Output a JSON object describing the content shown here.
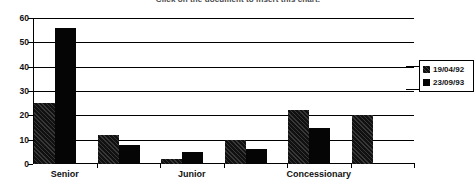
{
  "chart_data": {
    "type": "bar",
    "title": "Click on the document to insert this chart.",
    "xlabel": "",
    "ylabel": "",
    "ylim": [
      0,
      60
    ],
    "yticks": [
      0,
      10,
      20,
      30,
      40,
      50,
      60
    ],
    "ytick_labels": [
      "0",
      "10",
      "20",
      "30",
      "40",
      "50",
      "60"
    ],
    "grid": true,
    "grid_axis": "y",
    "legend_position": "right",
    "categories": [
      "Senior",
      "",
      "Junior",
      "",
      "Concessionary",
      ""
    ],
    "category_labels_shown": [
      "Senior",
      "Junior",
      "Concessionary"
    ],
    "series": [
      {
        "name": "19/04/92",
        "color": "#111111",
        "values": [
          25,
          12,
          2,
          10,
          22,
          20
        ]
      },
      {
        "name": "23/09/93",
        "color": "#050505",
        "values": [
          56,
          8,
          5,
          6,
          15,
          null
        ]
      }
    ]
  },
  "legend": {
    "items": [
      {
        "label": "19/04/92"
      },
      {
        "label": "23/09/93"
      }
    ]
  },
  "axes": {
    "y_labels": [
      "60",
      "50",
      "40",
      "30",
      "20",
      "10",
      "0"
    ],
    "x_labels": [
      "Senior",
      "Junior",
      "Concessionary"
    ]
  }
}
